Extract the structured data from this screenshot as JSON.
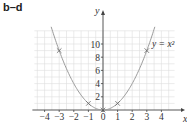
{
  "figure_label": "b–d",
  "curve_label": "y = x²",
  "chart_data": {
    "type": "line",
    "title": "b–d",
    "xlabel": "x",
    "ylabel": "y",
    "xlim": [
      -4.7,
      4.9
    ],
    "ylim": [
      0,
      12
    ],
    "xticks": [
      -4,
      -3,
      -2,
      -1,
      0,
      1,
      2,
      3,
      4
    ],
    "yticks": [
      2,
      4,
      6,
      8,
      10
    ],
    "grid": true,
    "series": [
      {
        "name": "y = x²",
        "function": "y = x^2",
        "type": "curve",
        "color": "#9a9a9a"
      },
      {
        "name": "plotted points",
        "type": "scatter",
        "marker": "x",
        "points": [
          [
            -3,
            9
          ],
          [
            -1,
            1
          ],
          [
            0,
            0
          ],
          [
            1,
            1
          ],
          [
            3,
            9
          ]
        ]
      }
    ],
    "annotations": [
      {
        "text": "y = x²",
        "x": 3,
        "y": 9
      }
    ]
  },
  "colors": {
    "grid": "#dddddd",
    "axis": "#444444",
    "curve": "#9a9a9a",
    "marker": "#666666"
  }
}
